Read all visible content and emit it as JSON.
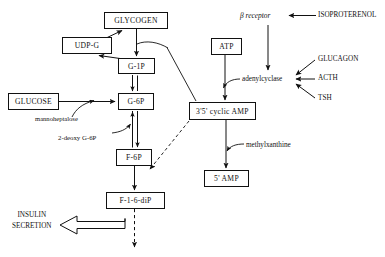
{
  "diagram": {
    "background_color": "#ffffff",
    "line_color": "#111111",
    "nodes": [
      {
        "id": "glycogen",
        "label": "GLYCOGEN",
        "x": 104,
        "y": 12,
        "w": 64,
        "h": 17,
        "font_size": 7.6
      },
      {
        "id": "udpg",
        "label": "UDP-G",
        "x": 62,
        "y": 37,
        "w": 50,
        "h": 17,
        "font_size": 7.6
      },
      {
        "id": "g1p",
        "label": "G-1P",
        "x": 118,
        "y": 58,
        "w": 37,
        "h": 16,
        "font_size": 7.6
      },
      {
        "id": "glucose",
        "label": "GLUCOSE",
        "x": 8,
        "y": 93,
        "w": 51,
        "h": 17,
        "font_size": 7.6
      },
      {
        "id": "g6p",
        "label": "G-6P",
        "x": 118,
        "y": 93,
        "w": 36,
        "h": 17,
        "font_size": 7.6
      },
      {
        "id": "f6p",
        "label": "F-6P",
        "x": 116,
        "y": 149,
        "w": 36,
        "h": 17,
        "font_size": 7.6
      },
      {
        "id": "f16dip",
        "label": "F-1-6-diP",
        "x": 106,
        "y": 192,
        "w": 59,
        "h": 17,
        "font_size": 7.6
      },
      {
        "id": "atp",
        "label": "ATP",
        "x": 211,
        "y": 38,
        "w": 31,
        "h": 17,
        "font_size": 7.6
      },
      {
        "id": "camp",
        "label": "3'5' cyclic AMP",
        "x": 189,
        "y": 102,
        "w": 67,
        "h": 18,
        "font_size": 7.6
      },
      {
        "id": "amp5",
        "label": "5' AMP",
        "x": 204,
        "y": 170,
        "w": 45,
        "h": 17,
        "font_size": 7.6
      }
    ],
    "labels": [
      {
        "id": "beta-receptor",
        "text": "β receptor",
        "x": 240,
        "y": 11,
        "font_size": 7.4,
        "italic": true
      },
      {
        "id": "isoproterenol",
        "text": "ISOPROTERENOL",
        "x": 318,
        "y": 11,
        "font_size": 7.2,
        "italic": false
      },
      {
        "id": "glucagon",
        "text": "GLUCAGON",
        "x": 318,
        "y": 55,
        "font_size": 7.2,
        "italic": false
      },
      {
        "id": "acth",
        "text": "ACTH",
        "x": 318,
        "y": 74,
        "font_size": 7.2,
        "italic": false
      },
      {
        "id": "tsh",
        "text": "TSH",
        "x": 318,
        "y": 94,
        "font_size": 7.2,
        "italic": false
      },
      {
        "id": "adenylcyclase",
        "text": "adenylcyclase",
        "x": 242,
        "y": 75,
        "font_size": 7.2,
        "italic": false
      },
      {
        "id": "methylxanthine",
        "text": "methylxanthine",
        "x": 246,
        "y": 141,
        "font_size": 7.2,
        "italic": false
      },
      {
        "id": "mannoheptalose",
        "text": "mannoheptalose",
        "x": 35,
        "y": 115,
        "font_size": 6.6,
        "italic": false
      },
      {
        "id": "2-deoxy-g6p",
        "text": "2-deoxy G-6P",
        "x": 58,
        "y": 134,
        "font_size": 6.8,
        "italic": false
      }
    ],
    "insulin_secretion": {
      "line1": "INSULIN",
      "line2": "SECRETION",
      "x": 12,
      "y": 210,
      "font_size": 7.2
    }
  }
}
